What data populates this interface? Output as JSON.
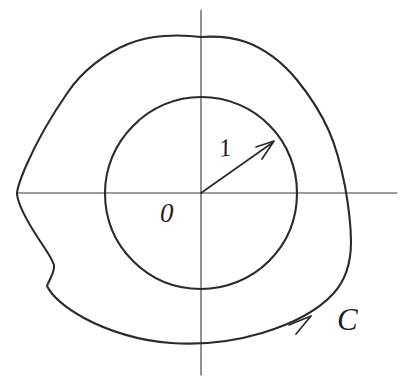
{
  "figure": {
    "kind": "hand-drawn-contour-diagram",
    "background_color": "#ffffff",
    "ink_color": "#2b2b2b",
    "axis_color": "#3a3a3a",
    "width": 401,
    "height": 380
  },
  "labels": {
    "origin": "0",
    "radius": "1",
    "contour": "C"
  },
  "geometry": {
    "origin": {
      "x": 201,
      "y": 193
    },
    "unit_circle": {
      "cx": 201,
      "cy": 193,
      "r": 96
    },
    "horizontal_axis": {
      "x1": 17,
      "y1": 193,
      "x2": 397,
      "y2": 193
    },
    "vertical_axis": {
      "x1": 201,
      "y1": 10,
      "x2": 201,
      "y2": 375
    },
    "radius_arrow": {
      "x1": 201,
      "y1": 193,
      "x2": 272,
      "y2": 143,
      "angle_deg": 35
    },
    "contour_arrow": {
      "x": 307,
      "y": 320,
      "direction": "counterclockwise"
    },
    "outer_contour_extents": {
      "left": 17,
      "top": 36,
      "right": 351,
      "bottom": 344
    }
  },
  "paths": {
    "outer_contour": "M 201 37 C 178 34 150 35 128 44 C 106 53 83 70 68 92 C 52 115 36 143 26 166 C 20 180 17 189 17 194 C 18 204 27 221 38 238 C 46 250 52 258 54 265 C 55 272 50 278 47 286 C 52 296 66 308 84 318 C 108 331 140 341 171 343 C 200 345 232 342 262 333 C 292 324 318 310 333 294 C 346 280 351 262 351 242 C 351 222 348 203 345 186 C 341 166 336 147 329 131 C 321 113 310 96 297 80 C 283 63 265 49 246 42 C 231 37 215 36 201 37 Z",
    "unit_circle": "M 201 97 C 227 97 252 107 270 126 C 288 144 297 169 297 193 C 297 219 287 243 269 261 C 251 279 226 289 201 289 C 175 289 151 279 133 261 C 115 243 105 219 105 193 C 105 168 115 144 133 126 C 151 107 176 97 201 97 Z"
  }
}
